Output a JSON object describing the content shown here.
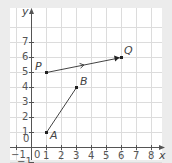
{
  "diagram": {
    "type": "coordinate-grid",
    "x_axis": {
      "label": "x",
      "min": -1,
      "max": 8,
      "ticks": [
        "-1",
        "0",
        "1",
        "2",
        "3",
        "4",
        "5",
        "6",
        "7",
        "8"
      ]
    },
    "y_axis": {
      "label": "y",
      "min": -1,
      "max": 7,
      "ticks": [
        "-1",
        "0",
        "1",
        "2",
        "3",
        "4",
        "5",
        "6",
        "7"
      ]
    },
    "points": [
      {
        "name": "A",
        "x": 1,
        "y": 1
      },
      {
        "name": "B",
        "x": 3,
        "y": 4
      },
      {
        "name": "P",
        "x": 1,
        "y": 5
      },
      {
        "name": "Q",
        "x": 6,
        "y": 6
      }
    ],
    "segments": [
      {
        "from": "A",
        "to": "B",
        "style": "line-segment"
      },
      {
        "from": "P",
        "to": "Q",
        "style": "vector-with-midpoint-arrow"
      }
    ],
    "colors": {
      "background": "#ececec",
      "grid_bg": "#ffffff",
      "grid_line": "#dcdcdc",
      "axis": "#555555",
      "line": "#444444"
    }
  }
}
